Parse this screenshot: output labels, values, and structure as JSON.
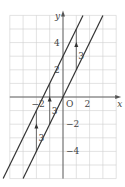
{
  "graph": {
    "x_range": [
      -4,
      4
    ],
    "y_range": [
      -6,
      6
    ],
    "origin_px": [
      63,
      97
    ],
    "unit_x_px": 13.3,
    "unit_y_px": 13.6,
    "grid": true,
    "colors": {
      "grid": "#cfcfcf",
      "axis": "#555555",
      "line": "#333333",
      "text": "#444444"
    },
    "axis_labels": {
      "x": "x",
      "y": "y",
      "origin": "O"
    },
    "x_ticks": [
      {
        "value": -2,
        "label": "−2"
      },
      {
        "value": 2,
        "label": "2"
      }
    ],
    "y_ticks": [
      {
        "value": 4,
        "label": "4"
      },
      {
        "value": 2,
        "label": "2"
      },
      {
        "value": -2,
        "label": "−2"
      },
      {
        "value": -4,
        "label": "−4"
      }
    ],
    "lines": [
      {
        "name": "y=2x+3",
        "slope": 2,
        "intercept": 3
      },
      {
        "name": "y=2x",
        "slope": 2,
        "intercept": 0
      }
    ],
    "translations": [
      {
        "x": 1,
        "from": 2,
        "to": 5,
        "label": "3"
      },
      {
        "x": -1,
        "from": -2,
        "to": 1,
        "label": "3"
      },
      {
        "x": -2,
        "from": -4,
        "to": -1,
        "label": "3"
      }
    ]
  }
}
